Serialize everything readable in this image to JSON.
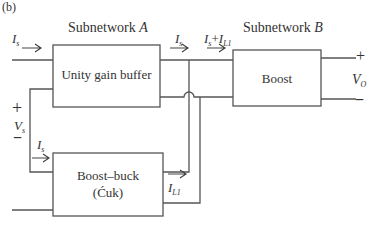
{
  "figure_label": "(b)",
  "subnetworks": {
    "a": {
      "title": "Subnetwork",
      "letter": "A"
    },
    "b": {
      "title": "Subnetwork",
      "letter": "B"
    }
  },
  "blocks": {
    "unity_gain_buffer": "Unity gain buffer",
    "boost": "Boost",
    "boost_buck_line1": "Boost–buck",
    "boost_buck_line2": "(Ćuk)"
  },
  "currents": {
    "is_input": {
      "main": "I",
      "sub": "s"
    },
    "is_buffer_out": {
      "main": "I",
      "sub": "s"
    },
    "is_plus_il1": {
      "a": "I",
      "a_sub": "s",
      "plus": "+",
      "b": "I",
      "b_sub": "L1"
    },
    "is_buckboost_in": {
      "main": "I",
      "sub": "s"
    },
    "il1": {
      "main": "I",
      "sub": "L1"
    }
  },
  "voltages": {
    "vs": {
      "main": "V",
      "sub": "s",
      "plus": "+",
      "minus": "−"
    },
    "vo": {
      "main": "V",
      "sub": "O",
      "plus": "+",
      "minus": "−"
    }
  },
  "colors": {
    "line": "#555555",
    "text": "#333333"
  }
}
